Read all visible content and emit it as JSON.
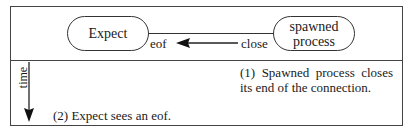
{
  "diagram": {
    "nodes": [
      {
        "id": "expect",
        "label": "Expect"
      },
      {
        "id": "spawned",
        "label_line1": "spawned",
        "label_line2": "process"
      }
    ],
    "connection": {
      "left_label": "eof",
      "right_label": "close",
      "arrow_direction": "left"
    },
    "timeline": {
      "axis_label": "time",
      "arrow_direction": "down"
    },
    "steps": [
      {
        "text": "(1) Spawned process closes its end of the connection."
      },
      {
        "text": "(2) Expect sees an eof."
      }
    ],
    "colors": {
      "line": "#333333",
      "text": "#1a1a1a",
      "background": "#ffffff"
    }
  }
}
